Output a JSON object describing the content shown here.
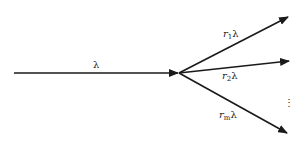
{
  "diagram": {
    "type": "flow-splitting",
    "input": {
      "label": "λ"
    },
    "branches": [
      {
        "label_r": "r",
        "label_sub": "1",
        "label_lambda": "λ"
      },
      {
        "label_r": "r",
        "label_sub": "2",
        "label_lambda": "λ"
      },
      {
        "label_r": "r",
        "label_sub": "m",
        "label_lambda": "λ"
      }
    ],
    "ellipsis": "⋮",
    "colors": {
      "line": "#1a1a1a",
      "background": "#ffffff"
    }
  }
}
